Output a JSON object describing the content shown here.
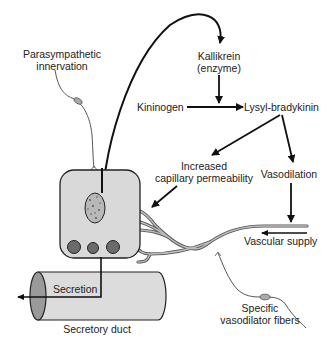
{
  "diagram": {
    "labels": {
      "parasympathetic": [
        "Parasympathetic",
        "innervation"
      ],
      "kallikrein": [
        "Kallikrein",
        "(enzyme)"
      ],
      "kininogen": "Kininogen",
      "lysyl_bradykinin": "Lysyl-bradykinin",
      "capillary_permeability": [
        "Increased",
        "capillary permeability"
      ],
      "vasodilation": "Vasodilation",
      "vascular_supply": "Vascular supply",
      "secretion": "Secretion",
      "secretory_duct": "Secretory duct",
      "vasodilator_fibers": [
        "Specific",
        "vasodilator fibers"
      ]
    },
    "colors": {
      "line": "#111111",
      "nerve": "#555555",
      "cell_fill": "#d9d9d9",
      "granule_fill": "#6b6b6b",
      "nucleus_fill": "#b8b8b8",
      "vessel_fill": "#a8a8a8",
      "duct_fill": "#dcdcdc",
      "duct_end_fill": "#9a9a9a"
    }
  }
}
